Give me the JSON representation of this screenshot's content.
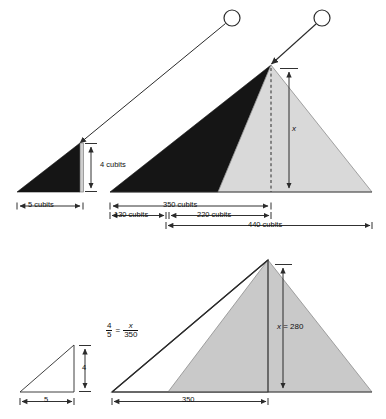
{
  "diagram": {
    "colors": {
      "shadow_dark": "#151515",
      "pyramid_fill": "#d9d9d9",
      "pyramid_fill_bottom": "#c9c9c9",
      "line": "#2b2b2b",
      "background": "#ffffff"
    },
    "top_panel": {
      "sun_left_name": "sun",
      "sun_right_name": "sun",
      "ray_left_name": "sun-ray",
      "ray_right_name": "sun-ray",
      "labels": {
        "stick_height": "4 cubits",
        "stick_shadow": "5 cubits",
        "pyramid_shadow": "350 cubits",
        "shadow_outside": "130 cubits",
        "half_base": "220 cubits",
        "full_base": "440 cubits",
        "pyramid_height": "x"
      }
    },
    "bottom_panel": {
      "labels": {
        "small_height": "4",
        "small_base": "5",
        "large_base": "350",
        "height_value": "x = 280"
      },
      "equation": {
        "left_num": "4",
        "left_den": "5",
        "equals": "=",
        "right_num": "x",
        "right_den": "350"
      }
    }
  }
}
